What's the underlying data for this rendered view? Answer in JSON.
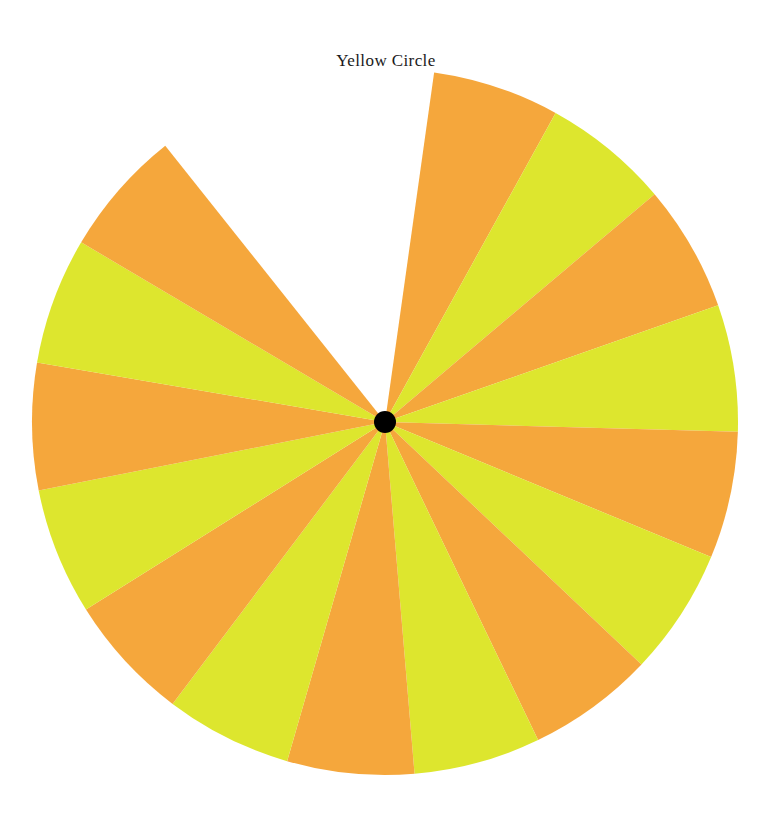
{
  "page": {
    "background_color": "#ffffff",
    "width": 772,
    "height": 817
  },
  "title": {
    "text": "Yellow Circle",
    "color": "#1a1a1a"
  },
  "chart_data": {
    "type": "pie",
    "title": "Yellow Circle",
    "subtitle": "",
    "xlabel": "",
    "ylabel": "",
    "legend_position": "none",
    "grid": false,
    "center": {
      "x": 385,
      "y": 422
    },
    "radius": 353,
    "hub": {
      "name": "center-dot",
      "radius": 11,
      "color": "#000000"
    },
    "start_angle_deg": 8,
    "slice_angle_deg": 20.9,
    "gap_angle_deg": 46.5,
    "missing_slice_count": 1,
    "total_slots": 16,
    "colors": {
      "orange": "#F5A73C",
      "yellow": "#DDE62E",
      "gap": "#ffffff",
      "hub": "#000000"
    },
    "categories": [
      "Slice 1",
      "Slice 2",
      "Slice 3",
      "Slice 4",
      "Slice 5",
      "Slice 6",
      "Slice 7",
      "Slice 8",
      "Slice 9",
      "Slice 10",
      "Slice 11",
      "Slice 12",
      "Slice 13",
      "Slice 14",
      "Slice 15",
      "Missing slice"
    ],
    "values": [
      20.9,
      20.9,
      20.9,
      20.9,
      20.9,
      20.9,
      20.9,
      20.9,
      20.9,
      20.9,
      20.9,
      20.9,
      20.9,
      20.9,
      20.9,
      46.5
    ],
    "slices": [
      {
        "index": 1,
        "label": "Slice 1",
        "color": "#F5A73C",
        "color_name": "orange",
        "start_deg": 8.0,
        "end_deg": 28.9,
        "sweep_deg": 20.9,
        "present": true
      },
      {
        "index": 2,
        "label": "Slice 2",
        "color": "#DDE62E",
        "color_name": "yellow",
        "start_deg": 28.9,
        "end_deg": 49.8,
        "sweep_deg": 20.9,
        "present": true
      },
      {
        "index": 3,
        "label": "Slice 3",
        "color": "#F5A73C",
        "color_name": "orange",
        "start_deg": 49.8,
        "end_deg": 70.7,
        "sweep_deg": 20.9,
        "present": true
      },
      {
        "index": 4,
        "label": "Slice 4",
        "color": "#DDE62E",
        "color_name": "yellow",
        "start_deg": 70.7,
        "end_deg": 91.6,
        "sweep_deg": 20.9,
        "present": true
      },
      {
        "index": 5,
        "label": "Slice 5",
        "color": "#F5A73C",
        "color_name": "orange",
        "start_deg": 91.6,
        "end_deg": 112.5,
        "sweep_deg": 20.9,
        "present": true
      },
      {
        "index": 6,
        "label": "Slice 6",
        "color": "#DDE62E",
        "color_name": "yellow",
        "start_deg": 112.5,
        "end_deg": 133.4,
        "sweep_deg": 20.9,
        "present": true
      },
      {
        "index": 7,
        "label": "Slice 7",
        "color": "#F5A73C",
        "color_name": "orange",
        "start_deg": 133.4,
        "end_deg": 154.3,
        "sweep_deg": 20.9,
        "present": true
      },
      {
        "index": 8,
        "label": "Slice 8",
        "color": "#DDE62E",
        "color_name": "yellow",
        "start_deg": 154.3,
        "end_deg": 175.2,
        "sweep_deg": 20.9,
        "present": true
      },
      {
        "index": 9,
        "label": "Slice 9",
        "color": "#F5A73C",
        "color_name": "orange",
        "start_deg": 175.2,
        "end_deg": 196.1,
        "sweep_deg": 20.9,
        "present": true
      },
      {
        "index": 10,
        "label": "Slice 10",
        "color": "#DDE62E",
        "color_name": "yellow",
        "start_deg": 196.1,
        "end_deg": 217.0,
        "sweep_deg": 20.9,
        "present": true
      },
      {
        "index": 11,
        "label": "Slice 11",
        "color": "#F5A73C",
        "color_name": "orange",
        "start_deg": 217.0,
        "end_deg": 237.9,
        "sweep_deg": 20.9,
        "present": true
      },
      {
        "index": 12,
        "label": "Slice 12",
        "color": "#DDE62E",
        "color_name": "yellow",
        "start_deg": 237.9,
        "end_deg": 258.8,
        "sweep_deg": 20.9,
        "present": true
      },
      {
        "index": 13,
        "label": "Slice 13",
        "color": "#F5A73C",
        "color_name": "orange",
        "start_deg": 258.8,
        "end_deg": 279.7,
        "sweep_deg": 20.9,
        "present": true
      },
      {
        "index": 14,
        "label": "Slice 14",
        "color": "#DDE62E",
        "color_name": "yellow",
        "start_deg": 279.7,
        "end_deg": 300.6,
        "sweep_deg": 20.9,
        "present": true
      },
      {
        "index": 15,
        "label": "Slice 15",
        "color": "#F5A73C",
        "color_name": "orange",
        "start_deg": 300.6,
        "end_deg": 321.5,
        "sweep_deg": 20.9,
        "present": true
      },
      {
        "index": 16,
        "label": "Missing slice",
        "color": "#ffffff",
        "color_name": "white",
        "start_deg": 321.5,
        "end_deg": 368.0,
        "sweep_deg": 46.5,
        "present": false
      }
    ]
  }
}
